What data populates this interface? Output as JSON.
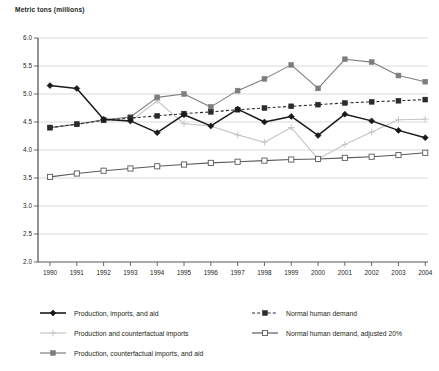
{
  "chart_data": {
    "type": "line",
    "title": "Metric tons (millions)",
    "xlabel": "",
    "ylabel": "Metric tons (millions)",
    "ylim": [
      2.0,
      6.0
    ],
    "ytick_step": 0.5,
    "yticks": [
      "2.0",
      "2.5",
      "3.0",
      "3.5",
      "4.0",
      "4.5",
      "5.0",
      "5.5",
      "6.0"
    ],
    "grid": true,
    "legend_position": "bottom",
    "categories": [
      "1990",
      "1991",
      "1992",
      "1993",
      "1994",
      "1995",
      "1996",
      "1997",
      "1998",
      "1999",
      "2000",
      "2001",
      "2002",
      "2003",
      "2004"
    ],
    "series": [
      {
        "name": "Production, imports, and aid",
        "marker": "diamond",
        "line": "solid",
        "color": "#1a1a1a",
        "values": [
          5.15,
          5.1,
          4.55,
          4.52,
          4.31,
          4.63,
          4.43,
          4.73,
          4.5,
          4.6,
          4.26,
          4.64,
          4.52,
          4.35,
          4.22
        ]
      },
      {
        "name": "Production and counterfactual imports",
        "marker": "plus",
        "line": "solid",
        "color": "#c6c6c6",
        "values": [
          4.4,
          4.46,
          4.54,
          4.51,
          4.88,
          4.47,
          4.43,
          4.27,
          4.14,
          4.4,
          3.84,
          4.1,
          4.32,
          4.54,
          4.55
        ]
      },
      {
        "name": "Production, counterfactual imports, and aid",
        "marker": "square-filled",
        "line": "solid",
        "color": "#7d7d7d",
        "values": [
          4.4,
          4.46,
          4.54,
          4.59,
          4.94,
          5.0,
          4.77,
          5.06,
          5.27,
          5.52,
          5.1,
          5.62,
          5.57,
          5.33,
          5.22
        ]
      },
      {
        "name": "Normal human demand",
        "marker": "square-filled",
        "line": "dashed",
        "color": "#2b2b2b",
        "values": [
          4.4,
          4.46,
          4.53,
          4.57,
          4.61,
          4.65,
          4.68,
          4.72,
          4.75,
          4.78,
          4.81,
          4.84,
          4.86,
          4.88,
          4.9
        ]
      },
      {
        "name": "Normal human demand, adjusted 20%",
        "marker": "square-open",
        "line": "solid",
        "color": "#5a5a5a",
        "values": [
          3.52,
          3.58,
          3.63,
          3.67,
          3.71,
          3.74,
          3.77,
          3.79,
          3.81,
          3.83,
          3.84,
          3.86,
          3.88,
          3.91,
          3.95
        ]
      }
    ]
  },
  "legend": {
    "entries": [
      {
        "label": "Production, imports, and aid"
      },
      {
        "label": "Production and counterfactual imports"
      },
      {
        "label": "Production, counterfactual imports, and aid"
      },
      {
        "label": "Normal human demand"
      },
      {
        "label": "Normal human demand, adjusted 20%"
      }
    ]
  }
}
